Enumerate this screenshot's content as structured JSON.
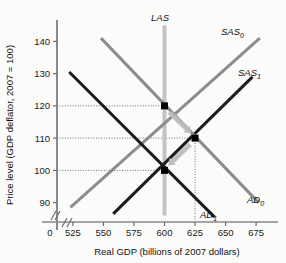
{
  "chart_data": {
    "type": "line",
    "title": "",
    "xlabel": "Real GDP (billions of 2007 dollars)",
    "ylabel": "Price level (GDP deflator, 2007 = 100)",
    "xlim": [
      512,
      688
    ],
    "ylim": [
      84,
      146
    ],
    "x_ticks": [
      "525",
      "550",
      "575",
      "600",
      "625",
      "650",
      "675"
    ],
    "x_tick_values": [
      525,
      550,
      575,
      600,
      625,
      650,
      675
    ],
    "y_ticks": [
      "90",
      "100",
      "110",
      "120",
      "130",
      "140"
    ],
    "y_tick_values": [
      90,
      100,
      110,
      120,
      130,
      140
    ],
    "origin_label": "0",
    "axis_break": true,
    "grid": false,
    "legend_position": "inline-curve-labels",
    "series": [
      {
        "name": "LAS",
        "label": "LAS",
        "label_sub": "",
        "kind": "vertical",
        "color": "#c3c3c3",
        "width": 4,
        "x": 600,
        "y_from": 86,
        "y_to": 145
      },
      {
        "name": "SAS0",
        "label": "SAS",
        "label_sub": "0",
        "kind": "upward",
        "color": "#8c8c8c",
        "width": 3,
        "points": [
          [
            523,
            88.5
          ],
          [
            678,
            141
          ]
        ]
      },
      {
        "name": "SAS1",
        "label": "SAS",
        "label_sub": "1",
        "kind": "upward",
        "color": "#1c1c1c",
        "width": 3,
        "points": [
          [
            558,
            86.5
          ],
          [
            672,
            129
          ]
        ]
      },
      {
        "name": "AD0",
        "label": "AD",
        "label_sub": "0",
        "kind": "downward",
        "color": "#8c8c8c",
        "width": 3,
        "points": [
          [
            548,
            141
          ],
          [
            677,
            90
          ]
        ]
      },
      {
        "name": "AD1",
        "label": "AD",
        "label_sub": "1",
        "kind": "downward",
        "color": "#1c1c1c",
        "width": 3,
        "points": [
          [
            522,
            130.5
          ],
          [
            641,
            85.5
          ]
        ]
      }
    ],
    "equilibria": [
      {
        "name": "point-a",
        "x": 600,
        "y": 120,
        "marker": "square",
        "color": "#000000"
      },
      {
        "name": "point-b",
        "x": 625,
        "y": 110,
        "marker": "square",
        "color": "#000000"
      },
      {
        "name": "point-c",
        "x": 600,
        "y": 100,
        "marker": "square",
        "color": "#000000"
      }
    ],
    "dotted_guides": [
      {
        "name": "guide-120",
        "orientation": "horizontal",
        "value": 120,
        "from": 512,
        "to": 600
      },
      {
        "name": "guide-110",
        "orientation": "horizontal",
        "value": 110,
        "from": 512,
        "to": 625
      },
      {
        "name": "guide-100",
        "orientation": "horizontal",
        "value": 100,
        "from": 512,
        "to": 600
      },
      {
        "name": "guide-625",
        "orientation": "vertical",
        "value": 625,
        "from": 84,
        "to": 110
      }
    ],
    "annotations": [
      {
        "name": "arrow-a-to-b",
        "from": [
          604,
          118
        ],
        "to": [
          622,
          111.5
        ],
        "color": "#bdbdbd"
      },
      {
        "name": "arrow-b-to-c",
        "from": [
          621,
          108
        ],
        "to": [
          603,
          101.5
        ],
        "color": "#bdbdbd"
      }
    ]
  },
  "axes": {
    "x_title": "Real GDP (billions of 2007 dollars)",
    "y_title": "Price level (GDP deflator, 2007 = 100)",
    "origin": "0"
  },
  "labels": {
    "las": "LAS",
    "sas": "SAS",
    "ad": "AD",
    "sub_0": "0",
    "sub_1": "1"
  }
}
